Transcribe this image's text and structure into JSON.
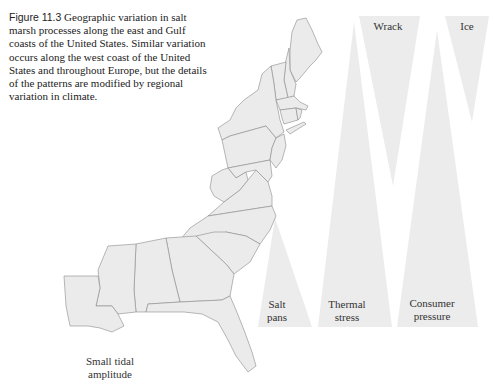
{
  "caption": {
    "label": "Figure 11.3",
    "text": " Geographic variation in salt marsh processes along the east and Gulf coasts of the United States. Similar variation occurs along the west coast of the United States and throughout Europe, but the details of the patterns are modified by regional variation in climate."
  },
  "map": {
    "region": "East and Gulf coasts of the United States",
    "annotation": [
      "Small tidal",
      "amplitude"
    ]
  },
  "processes": [
    {
      "name": "Salt pans",
      "lines": [
        "Salt",
        "pans"
      ],
      "orientation": "increasing-southward"
    },
    {
      "name": "Thermal stress",
      "lines": [
        "Thermal",
        "stress"
      ],
      "orientation": "increasing-southward"
    },
    {
      "name": "Consumer pressure",
      "lines": [
        "Consumer",
        "pressure"
      ],
      "orientation": "increasing-southward"
    },
    {
      "name": "Wrack",
      "lines": [
        "Wrack"
      ],
      "orientation": "increasing-northward"
    },
    {
      "name": "Ice",
      "lines": [
        "Ice"
      ],
      "orientation": "increasing-northward"
    }
  ],
  "colors": {
    "wedge_fill": "#ececec",
    "map_fill": "#ebebeb",
    "map_stroke": "#8a8a8a"
  }
}
